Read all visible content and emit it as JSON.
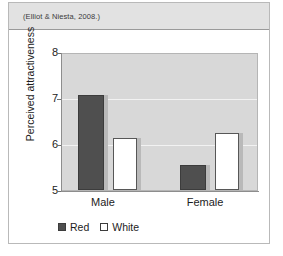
{
  "figure": {
    "citation": "(Elliot & Niesta, 2008.)"
  },
  "legend": {
    "items": [
      {
        "label": "Red",
        "swatch": "filled-dark-square-icon"
      },
      {
        "label": "White",
        "swatch": "outlined-white-square-icon"
      }
    ]
  },
  "axes": {
    "y_title": "Perceived attractiveness",
    "y_ticks": [
      "8",
      "7",
      "6",
      "5"
    ],
    "x_ticks": [
      "Male",
      "Female"
    ]
  },
  "colors": {
    "red_series": "#4f4f4f",
    "white_series": "#ffffff",
    "plot_background": "#d8d8d8",
    "gridline": "#f2f2f2",
    "header_band": "#e2e2e2"
  },
  "chart_data": {
    "type": "bar",
    "title": "",
    "subtitle": "",
    "xlabel": "",
    "ylabel": "Perceived attractiveness",
    "categories": [
      "Male",
      "Female"
    ],
    "series": [
      {
        "name": "Red",
        "values": [
          7.1,
          5.55
        ],
        "color": "#4f4f4f"
      },
      {
        "name": "White",
        "values": [
          6.15,
          6.25
        ],
        "color": "#ffffff"
      }
    ],
    "ylim": [
      5,
      8
    ],
    "yticks": [
      5,
      6,
      7,
      8
    ],
    "grid": true,
    "legend_position": "bottom-left",
    "annotation": "(Elliot & Niesta, 2008.)"
  }
}
